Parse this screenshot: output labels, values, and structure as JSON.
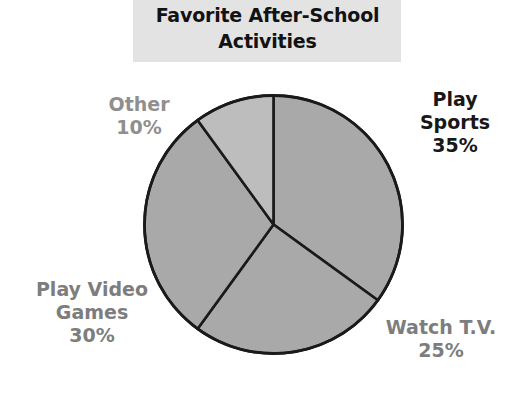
{
  "title": {
    "text": "Favorite After-School\nActivities",
    "band_color": "#e3e3e3",
    "text_color": "#121212"
  },
  "chart_data": {
    "type": "pie",
    "title": "Favorite After-School Activities",
    "categories": [
      "Play Sports",
      "Watch T.V.",
      "Play Video Games",
      "Other"
    ],
    "values": [
      35,
      25,
      30,
      10
    ],
    "value_unit": "%",
    "legend": "none",
    "labels_position": "outside",
    "slice_colors": [
      "#a9a9a9",
      "#a9a9a9",
      "#a9a9a9",
      "#bdbdbd"
    ],
    "outline_color": "#1a1a1a",
    "start_angle_deg": 0,
    "direction": "clockwise",
    "slices": [
      {
        "name": "Play Sports",
        "value": 35,
        "label": "Play Sports\n35%",
        "percent_text": "35%",
        "color": "#a9a9a9",
        "start_deg": 0,
        "end_deg": 126
      },
      {
        "name": "Watch T.V.",
        "value": 25,
        "label": "Watch T.V.\n25%",
        "percent_text": "25%",
        "color": "#a9a9a9",
        "start_deg": 126,
        "end_deg": 216
      },
      {
        "name": "Play Video Games",
        "value": 30,
        "label": "Play Video\nGames\n30%",
        "percent_text": "30%",
        "color": "#a9a9a9",
        "start_deg": 216,
        "end_deg": 324
      },
      {
        "name": "Other",
        "value": 10,
        "label": "Other\n10%",
        "percent_text": "10%",
        "color": "#bdbdbd",
        "start_deg": 324,
        "end_deg": 360
      }
    ]
  },
  "labels": {
    "play_sports": "Play\nSports\n35%",
    "other": "Other\n10%",
    "play_video_games": "Play Video\nGames\n30%",
    "watch_tv": "Watch T.V.\n25%"
  }
}
